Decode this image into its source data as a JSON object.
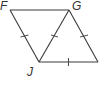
{
  "diagram": {
    "type": "geometry-figure",
    "shape": "parallelogram with diagonal",
    "colors": {
      "stroke": "#3a3a3a",
      "label": "#333333",
      "background": "#ffffff"
    },
    "vertices": [
      {
        "id": "F",
        "label": "F",
        "x": 10,
        "y": 10
      },
      {
        "id": "G",
        "label": "G",
        "x": 69,
        "y": 10
      },
      {
        "id": "J",
        "label": "J",
        "x": 39,
        "y": 62
      },
      {
        "id": "K",
        "label": "",
        "x": 98,
        "y": 62
      }
    ],
    "segments": [
      {
        "from": "F",
        "to": "G",
        "tick_marks": 0
      },
      {
        "from": "F",
        "to": "J",
        "tick_marks": 1
      },
      {
        "from": "G",
        "to": "J",
        "tick_marks": 1
      },
      {
        "from": "G",
        "to": "K",
        "tick_marks": 1
      },
      {
        "from": "J",
        "to": "K",
        "tick_marks": 1
      }
    ],
    "labels": {
      "F": "F",
      "G": "G",
      "J": "J"
    }
  }
}
